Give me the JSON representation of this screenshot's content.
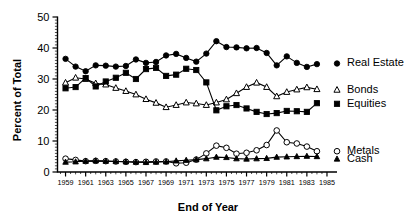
{
  "chart_data": {
    "type": "line",
    "title": "",
    "xlabel": "End of Year",
    "ylabel": "Percent of Total",
    "xlim": [
      1958.2,
      1985.4
    ],
    "ylim": [
      0,
      50
    ],
    "yticks": [
      0,
      10,
      20,
      30,
      40,
      50
    ],
    "xticks": [
      1959,
      1961,
      1963,
      1965,
      1967,
      1969,
      1971,
      1973,
      1975,
      1977,
      1979,
      1981,
      1983,
      1985
    ],
    "xticklabels": [
      "1959",
      "1961",
      "1963",
      "1965",
      "1967",
      "1969",
      "1971",
      "1973",
      "1975",
      "1977",
      "1979",
      "1981",
      "1983",
      "1985"
    ],
    "yticklabels": [
      "0",
      "10",
      "20",
      "30",
      "40",
      "50"
    ],
    "grid": false,
    "legend_position": "right-inline",
    "minor_ticks": true,
    "x": [
      1959,
      1960,
      1961,
      1962,
      1963,
      1964,
      1965,
      1966,
      1967,
      1968,
      1969,
      1970,
      1971,
      1972,
      1973,
      1974,
      1975,
      1976,
      1977,
      1978,
      1979,
      1980,
      1981,
      1982,
      1983,
      1984
    ],
    "series": [
      {
        "name": "Real Estate",
        "marker": "filled-circle",
        "color": "#000000",
        "values": [
          36.5,
          34.0,
          32.5,
          34.4,
          34.3,
          34.0,
          34.2,
          36.3,
          35.2,
          35.5,
          37.6,
          38.1,
          36.8,
          35.6,
          38.2,
          42.2,
          40.3,
          40.2,
          39.9,
          40.0,
          38.4,
          34.4,
          37.3,
          35.2,
          33.9,
          34.8
        ]
      },
      {
        "name": "Bonds",
        "marker": "open-triangle",
        "color": "#000000",
        "values": [
          28.8,
          30.4,
          30.0,
          28.6,
          28.2,
          27.1,
          26.1,
          25.0,
          23.5,
          22.3,
          20.9,
          21.6,
          22.4,
          22.1,
          21.6,
          22.4,
          23.4,
          25.4,
          27.4,
          28.8,
          27.4,
          24.4,
          25.8,
          26.6,
          27.3,
          26.7
        ]
      },
      {
        "name": "Equities",
        "marker": "filled-square",
        "color": "#000000",
        "values": [
          27.0,
          27.4,
          30.3,
          27.6,
          29.2,
          30.4,
          32.0,
          30.0,
          33.2,
          33.6,
          31.0,
          31.4,
          33.3,
          32.9,
          28.9,
          19.9,
          21.2,
          21.6,
          20.5,
          19.4,
          18.7,
          19.0,
          19.7,
          19.6,
          19.4,
          22.2
        ]
      },
      {
        "name": "Metals",
        "marker": "open-circle",
        "color": "#000000",
        "values": [
          4.3,
          3.9,
          3.5,
          3.6,
          3.5,
          3.4,
          3.3,
          3.2,
          3.3,
          3.4,
          3.4,
          2.8,
          3.0,
          4.0,
          6.0,
          8.5,
          7.8,
          5.9,
          6.2,
          7.0,
          8.7,
          13.4,
          9.6,
          9.2,
          8.2,
          6.7
        ]
      },
      {
        "name": "Cash",
        "marker": "filled-triangle",
        "color": "#000000",
        "values": [
          3.2,
          3.3,
          3.5,
          3.6,
          3.5,
          3.4,
          3.3,
          3.2,
          3.1,
          3.2,
          3.3,
          3.6,
          3.8,
          4.0,
          4.3,
          4.8,
          4.7,
          4.3,
          4.2,
          4.3,
          4.4,
          4.8,
          4.9,
          5.0,
          5.1,
          5.0
        ]
      }
    ],
    "legend_entries": [
      {
        "label": "Real Estate",
        "marker": "filled-circle",
        "y_value": 35.0
      },
      {
        "label": "Bonds",
        "marker": "open-triangle",
        "y_value": 26.5
      },
      {
        "label": "Equities",
        "marker": "filled-square",
        "y_value": 22.0
      },
      {
        "label": "Metals",
        "marker": "open-circle",
        "y_value": 6.7
      },
      {
        "label": "Cash",
        "marker": "filled-triangle",
        "y_value": 4.2
      }
    ]
  }
}
